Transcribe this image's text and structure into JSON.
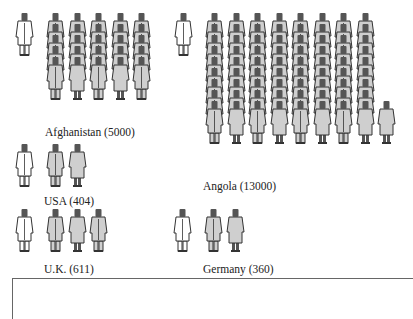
{
  "chart_data": {
    "type": "pictogram",
    "title": "",
    "unit_note": "Each gray figure stack column represents population per doctor; white figure = one doctor",
    "legend": [
      {
        "symbol": "white-doctor-figure",
        "meaning": "1 doctor"
      },
      {
        "symbol": "gray-person-figure",
        "meaning": "population per doctor"
      }
    ],
    "categories": [
      "Afghanistan",
      "Angola",
      "USA",
      "U.K.",
      "Germany"
    ],
    "values": [
      5000,
      13000,
      404,
      611,
      360
    ],
    "series": [
      {
        "name": "People per doctor",
        "values": [
          5000,
          13000,
          404,
          611,
          360
        ]
      }
    ]
  },
  "groups": [
    {
      "id": "afghanistan",
      "label": "Afghanistan (5000)",
      "x": 14,
      "y": 12,
      "cols": 5,
      "stack": 5,
      "partial": 0,
      "label_x": 45,
      "label_y": 126
    },
    {
      "id": "angola",
      "label": "Angola (13000)",
      "x": 173,
      "y": 12,
      "cols": 8,
      "stack": 9,
      "partial": 1,
      "label_x": 203,
      "label_y": 180
    },
    {
      "id": "usa",
      "label": "USA (404)",
      "x": 14,
      "y": 143,
      "cols": 2,
      "stack": 1,
      "partial": 0,
      "label_x": 44,
      "label_y": 195
    },
    {
      "id": "uk",
      "label": "U.K. (611)",
      "x": 14,
      "y": 208,
      "cols": 3,
      "stack": 1,
      "partial": 0,
      "label_x": 44,
      "label_y": 263
    },
    {
      "id": "germany",
      "label": "Germany (360)",
      "x": 172,
      "y": 208,
      "cols": 2,
      "stack": 1,
      "partial": 0,
      "label_x": 203,
      "label_y": 263
    }
  ],
  "colors": {
    "doctor_fill": "#ffffff",
    "person_fill": "#cfcfcf",
    "outline": "#333333",
    "head": "#555555"
  }
}
